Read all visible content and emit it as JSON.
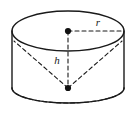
{
  "figure": {
    "type": "geometry-diagram",
    "shape": "cylinder-with-inscribed-cone",
    "background_color": "#ffffff",
    "stroke_color": "#1a1a1a",
    "width": 136,
    "height": 115,
    "labels": {
      "radius": "r",
      "height": "h"
    },
    "geometry": {
      "top_ellipse": {
        "cx": 68,
        "cy": 31,
        "rx": 56,
        "ry": 20,
        "style": "solid"
      },
      "bottom_ellipse": {
        "cx": 68,
        "cy": 88,
        "rx": 56,
        "ry": 15,
        "front_style": "solid",
        "back_style": "dashed"
      },
      "left_edge_x": 12,
      "right_edge_x": 124,
      "top_center_point": {
        "x": 68,
        "y": 31
      },
      "bottom_apex_point": {
        "x": 68,
        "y": 88
      },
      "radius_line": {
        "from": [
          68,
          31
        ],
        "to": [
          124,
          31
        ],
        "style": "dashed"
      },
      "height_line": {
        "from": [
          68,
          31
        ],
        "to": [
          68,
          88
        ],
        "style": "dashed"
      },
      "cone_side_left": {
        "from": [
          68,
          88
        ],
        "to": [
          14,
          41
        ],
        "style": "dashed"
      },
      "cone_side_right": {
        "from": [
          68,
          88
        ],
        "to": [
          122,
          41
        ],
        "style": "dashed"
      }
    },
    "label_positions": {
      "radius": {
        "x": 98,
        "y": 26
      },
      "height": {
        "x": 56,
        "y": 64
      }
    }
  }
}
